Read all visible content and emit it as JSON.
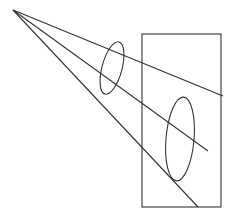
{
  "diagram": {
    "stroke_color": "#333333",
    "background": "#ffffff",
    "apex": {
      "x": 13,
      "y": 10
    },
    "rays": [
      {
        "name": "upper-ray",
        "x1": 13,
        "y1": 10,
        "x2": 223,
        "y2": 96
      },
      {
        "name": "middle-ray",
        "x1": 13,
        "y1": 10,
        "x2": 208,
        "y2": 151
      },
      {
        "name": "lower-ray",
        "x1": 13,
        "y1": 10,
        "x2": 198,
        "y2": 207
      }
    ],
    "ellipses": [
      {
        "name": "small-ellipse",
        "cx": 112,
        "cy": 68,
        "rx": 10,
        "ry": 27,
        "rotate": 15
      },
      {
        "name": "large-ellipse",
        "cx": 180,
        "cy": 139,
        "rx": 14,
        "ry": 42,
        "rotate": 5
      }
    ],
    "rectangle": {
      "name": "picture-plane",
      "x": 142,
      "y": 34,
      "width": 79,
      "height": 173
    }
  }
}
